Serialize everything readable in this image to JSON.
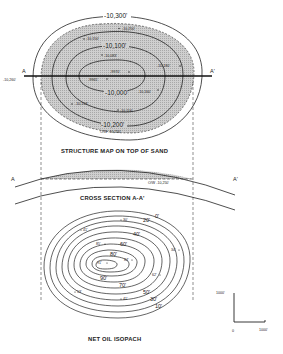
{
  "structure_map": {
    "title": "STRUCTURE MAP ON TOP OF SAND",
    "section_line": {
      "start_label": "A",
      "end_label": "A'"
    },
    "contours": [
      {
        "label": "-10,300'"
      },
      {
        "label": "-10,200'"
      },
      {
        "label": "-10,100'"
      },
      {
        "label": "-10,000'"
      }
    ],
    "well_labels": [
      "-10,250'",
      "-10,150'",
      "-10,083'",
      "-9970'",
      "-9965'",
      "-10,180'",
      "-10,160'",
      "-10,153'",
      "-10,116'",
      "-10,260'"
    ],
    "owc_label": "O/W -10,250'",
    "shading_color": "#c8c8c8"
  },
  "cross_section": {
    "title": "CROSS SECTION A-A'",
    "start_label": "A",
    "end_label": "A'",
    "owc_label": "O/W -10,250'"
  },
  "isopach": {
    "title": "NET OIL ISOPACH",
    "contour_labels": [
      "0'",
      "10'",
      "20'",
      "30'",
      "40'",
      "50'",
      "60'",
      "70'",
      "80'",
      "90'"
    ],
    "well_labels": [
      "30'",
      "41'",
      "85'",
      "91'",
      "84'",
      "62'",
      "53'",
      "41'",
      "34'"
    ]
  },
  "scale_bar": {
    "vertical_label": "1000'",
    "origin_label": "0",
    "horizontal_label": "1000'"
  }
}
